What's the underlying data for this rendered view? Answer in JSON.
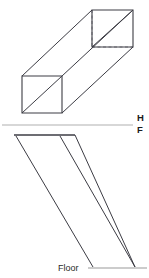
{
  "figure": {
    "background_color": "#ffffff",
    "width": 149,
    "height": 278
  },
  "colors": {
    "object_line": "#3c3c44",
    "hidden_line": "#8c8c94",
    "reference_line": "#b0b0b0",
    "floor_line": "#9a9a9a",
    "shadow_line": "#3c3c44",
    "text": "#2b2b2b",
    "fold_text": "#1a1a1a"
  },
  "top_view": {
    "name": "pictorial-prism",
    "description": "Isometric rectangular tube shown in the horizontal (top) view",
    "near_face": {
      "top_left": [
        22,
        76
      ],
      "top_right": [
        62,
        76
      ],
      "bottom_right": [
        62,
        113
      ],
      "bottom_left": [
        22,
        113
      ],
      "diagonal": [
        [
          22,
          113
        ],
        [
          62,
          76
        ]
      ]
    },
    "far_face": {
      "top_left": [
        92,
        10
      ],
      "top_right": [
        133,
        10
      ],
      "bottom_right": [
        133,
        47
      ],
      "bottom_left": [
        92,
        47
      ],
      "diagonal": [
        [
          92,
          47
        ],
        [
          133,
          10
        ]
      ]
    },
    "connecting_edges": [
      [
        [
          22,
          76
        ],
        [
          92,
          10
        ]
      ],
      [
        [
          62,
          76
        ],
        [
          133,
          10
        ]
      ],
      [
        [
          62,
          113
        ],
        [
          133,
          47
        ]
      ]
    ],
    "hidden_edges": [
      [
        [
          92,
          10
        ],
        [
          92,
          47
        ]
      ],
      [
        [
          92,
          47
        ],
        [
          133,
          47
        ]
      ]
    ]
  },
  "fold_line": {
    "name": "h-f-reference-line",
    "y": 125,
    "x_start": 2,
    "x_end": 133,
    "upper_label": "H",
    "lower_label": "F",
    "label_x": 137,
    "upper_label_y": 121,
    "lower_label_y": 133
  },
  "front_view": {
    "name": "shadow-projection",
    "description": "Front view of the prism with slanted light rays casting a shadow onto the floor",
    "top_edge": [
      [
        14,
        135
      ],
      [
        75,
        135
      ]
    ],
    "rays": [
      [
        [
          16,
          136
        ],
        [
          93,
          267
        ]
      ],
      [
        [
          60,
          136
        ],
        [
          135,
          267
        ]
      ],
      [
        [
          75,
          135
        ],
        [
          135,
          267
        ]
      ]
    ]
  },
  "floor": {
    "name": "floor-line",
    "label": "Floor",
    "label_x": 58,
    "label_y": 271,
    "line_y": 268,
    "line_x_start": 88,
    "line_x_end": 147
  }
}
